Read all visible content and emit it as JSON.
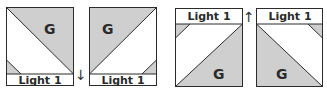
{
  "colors": {
    "fabric_gray": "#cfcfcf",
    "outline": "#2b2b2b",
    "background": "#ffffff"
  },
  "panels": [
    {
      "label": "Light 1",
      "fabric": "G",
      "strip_position": "bottom"
    },
    {
      "label": "Light 1",
      "fabric": "G",
      "strip_position": "bottom"
    },
    {
      "label": "Light 1",
      "fabric": "G",
      "strip_position": "top"
    },
    {
      "label": "Light 1",
      "fabric": "G",
      "strip_position": "top"
    }
  ],
  "arrows": [
    {
      "direction": "down",
      "glyph": "↓"
    },
    {
      "direction": "up",
      "glyph": "↑"
    }
  ]
}
